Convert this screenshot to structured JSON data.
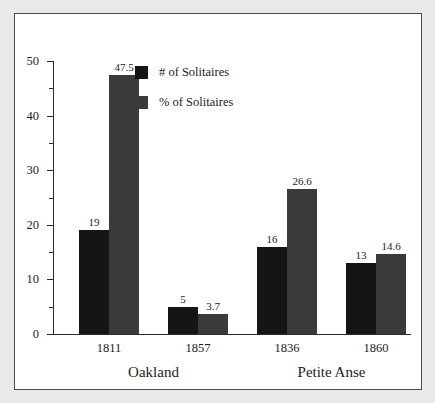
{
  "chart_data": {
    "type": "bar",
    "title": "",
    "subtitle": "",
    "xlabel": "",
    "ylabel": "",
    "ylim": [
      0,
      50
    ],
    "y_major_ticks": [
      0,
      10,
      20,
      30,
      40,
      50
    ],
    "y_minor_ticks": [
      5,
      15,
      25,
      35,
      45
    ],
    "y_tick_labels": [
      "0",
      "10",
      "20",
      "30",
      "40",
      "50"
    ],
    "grid": false,
    "legend_position": "inside-top-center",
    "categories": [
      "1811",
      "1857",
      "1836",
      "1860",
      "1842",
      "1860"
    ],
    "groups": [
      {
        "label": "Oakland",
        "categories": [
          "1811",
          "1857"
        ]
      },
      {
        "label": "Petite Anse",
        "categories": [
          "1836",
          "1860"
        ]
      },
      {
        "label": "Tiger Island",
        "categories": [
          "1842",
          "1860"
        ]
      }
    ],
    "series": [
      {
        "name": "# of Solitaires",
        "color": "#151515",
        "values": [
          19,
          5,
          16,
          13,
          38,
          23
        ],
        "value_labels": [
          "19",
          "5",
          "16",
          "13",
          "38",
          "23"
        ]
      },
      {
        "name": "% of Solitaires",
        "color": "#3a3a3a",
        "values": [
          47.5,
          3.7,
          26.6,
          14.6,
          37.7,
          15.7
        ],
        "value_labels": [
          "47.5",
          "3.7",
          "26.6",
          "14.6",
          "37.7",
          "15.7"
        ]
      }
    ]
  },
  "legend": {
    "items": [
      {
        "label": "# of Solitaires",
        "swatch": "count"
      },
      {
        "label": "% of Solitaires",
        "swatch": "percent"
      }
    ]
  },
  "colors": {
    "series_count": "#151515",
    "series_percent": "#3a3a3a",
    "axis": "#2b2b2b",
    "text": "#1b1b1b",
    "card_background": "#ffffff",
    "card_border": "#4a4a4a",
    "page_background": "#e9e9e7"
  }
}
